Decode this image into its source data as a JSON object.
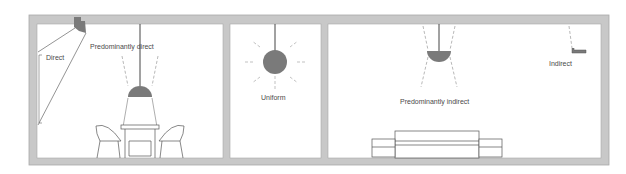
{
  "diagram": {
    "type": "lighting-distribution-illustration",
    "rooms": [
      {
        "id": "room-1",
        "labels": {
          "direct": "Direct",
          "predominantly_direct": "Predominantly direct"
        },
        "furniture": [
          "dining-table",
          "chair-left",
          "chair-right",
          "chair-back"
        ]
      },
      {
        "id": "room-2",
        "labels": {
          "uniform": "Uniform"
        }
      },
      {
        "id": "room-3",
        "labels": {
          "predominantly_indirect": "Predominantly indirect",
          "indirect": "Indirect"
        },
        "furniture": [
          "bed",
          "nightstand-left",
          "nightstand-right"
        ]
      }
    ],
    "colors": {
      "wall": "#c8c8c8",
      "wall_edge": "#a9a9a9",
      "lamp_fill": "#7a7a7a",
      "line": "#555555",
      "light_line": "#9a9a9a",
      "text": "#4a4a4a",
      "background": "#ffffff"
    }
  }
}
